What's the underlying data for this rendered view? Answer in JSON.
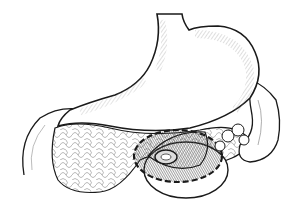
{
  "illustration": {
    "subject": "stomach with pancreas and excision region",
    "style": "black ink line drawing with hatching",
    "colors": {
      "background": "#ffffff",
      "ink": "#1a1a1a",
      "hatch": "#8a8a8a",
      "shade": "#555555"
    },
    "labels": []
  }
}
